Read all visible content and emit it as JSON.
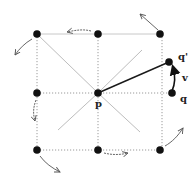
{
  "diagram": {
    "type": "grid-neighborhood",
    "colors": {
      "node": "#111111",
      "grid": "#9a9a9a",
      "diagonal": "#b8b8b8",
      "edge": "#1a1a1a",
      "arrow": "#555555"
    },
    "nodes": [
      {
        "id": "tl",
        "x": 37,
        "y": 34
      },
      {
        "id": "tc",
        "x": 98,
        "y": 34
      },
      {
        "id": "tr",
        "x": 160,
        "y": 34
      },
      {
        "id": "ml",
        "x": 37,
        "y": 93
      },
      {
        "id": "p",
        "x": 98,
        "y": 93,
        "label": "p"
      },
      {
        "id": "q",
        "x": 172,
        "y": 93,
        "label": "q"
      },
      {
        "id": "q_prime",
        "x": 169,
        "y": 62,
        "label": "q'"
      },
      {
        "id": "bl",
        "x": 37,
        "y": 150
      },
      {
        "id": "bc",
        "x": 98,
        "y": 150
      },
      {
        "id": "br",
        "x": 160,
        "y": 150
      }
    ],
    "labels": {
      "p": "p",
      "q": "q",
      "q_prime": "q'",
      "v": "v"
    }
  }
}
